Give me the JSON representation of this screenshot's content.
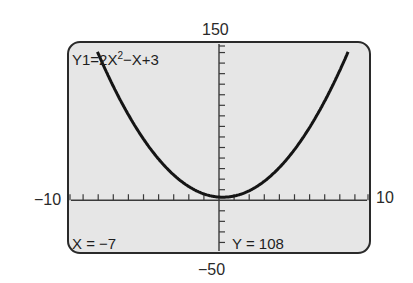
{
  "window": {
    "ymax_label": "150",
    "ymin_label": "−50",
    "xmin_label": "−10",
    "xmax_label": "10"
  },
  "screen": {
    "equation_prefix": "Y1=2X",
    "equation_exponent": "2",
    "equation_suffix": "−X+3",
    "trace_x": "X = −7",
    "trace_y": "Y = 108",
    "background": "#e6e6e6",
    "border": "#2a2a2a",
    "curve_color": "#151515"
  },
  "chart_data": {
    "type": "line",
    "function": "y = 2x^2 - x + 3",
    "xlabel": "",
    "ylabel": "",
    "xlim": [
      -10,
      10
    ],
    "ylim": [
      -50,
      150
    ],
    "xscale": 1,
    "yscale": 10,
    "grid": false,
    "series": [
      {
        "name": "Y1",
        "x": [
          -8.4,
          -8,
          -7,
          -6,
          -5,
          -4,
          -3,
          -2,
          -1,
          0,
          1,
          2,
          3,
          4,
          5,
          6,
          7,
          8,
          8.8
        ],
        "values": [
          152.5,
          139,
          108,
          81,
          58,
          39,
          24,
          13,
          6,
          3,
          4,
          9,
          18,
          31,
          48,
          69,
          94,
          123,
          150.1
        ]
      }
    ],
    "trace_point": {
      "x": -7,
      "y": 108
    },
    "annotations": [
      "X = −7",
      "Y = 108"
    ]
  }
}
